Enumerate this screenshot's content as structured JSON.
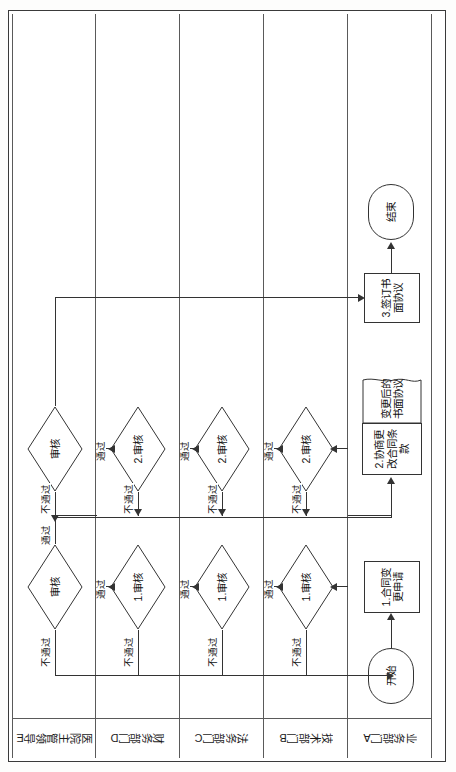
{
  "diagram": {
    "type": "swimlane-flowchart",
    "orientation": "rotated-90-ccw",
    "title_visible": false,
    "lanes": [
      {
        "id": "E",
        "label": "医院主管领导E"
      },
      {
        "id": "D",
        "label": "财务部门D"
      },
      {
        "id": "C",
        "label": "法务部门C"
      },
      {
        "id": "B",
        "label": "技术部门B"
      },
      {
        "id": "A",
        "label": "业务部门A"
      }
    ],
    "nodes": {
      "start": {
        "label": "开始",
        "shape": "terminator",
        "lane": "A"
      },
      "p1": {
        "label": "1.合同变更申请",
        "shape": "process",
        "lane": "A"
      },
      "p2": {
        "label": "2.协商更改合同条款",
        "shape": "process",
        "lane": "A"
      },
      "doc1": {
        "label": "变更后的书面协议",
        "shape": "document",
        "lane": "A"
      },
      "p3": {
        "label": "3.签订书面协议",
        "shape": "process",
        "lane": "A"
      },
      "end": {
        "label": "结束",
        "shape": "terminator",
        "lane": "A"
      },
      "b1": {
        "label": "1.审核",
        "shape": "decision",
        "lane": "B"
      },
      "b2": {
        "label": "2.审核",
        "shape": "decision",
        "lane": "B"
      },
      "c1": {
        "label": "1.审核",
        "shape": "decision",
        "lane": "C"
      },
      "c2": {
        "label": "2.审核",
        "shape": "decision",
        "lane": "C"
      },
      "d1": {
        "label": "1.审核",
        "shape": "decision",
        "lane": "D"
      },
      "d2": {
        "label": "2.审核",
        "shape": "decision",
        "lane": "D"
      },
      "e1": {
        "label": "审核",
        "shape": "decision",
        "lane": "E"
      },
      "e2": {
        "label": "审核",
        "shape": "decision",
        "lane": "E"
      }
    },
    "edge_labels": {
      "pass": "通过",
      "fail": "不通过"
    },
    "edges": [
      {
        "from": "start",
        "to": "p1",
        "label": ""
      },
      {
        "from": "p1",
        "to": "b1",
        "label": ""
      },
      {
        "from": "b1",
        "to": "c1",
        "label": "通过"
      },
      {
        "from": "b1",
        "to": "p1",
        "label": "不通过"
      },
      {
        "from": "c1",
        "to": "d1",
        "label": "通过"
      },
      {
        "from": "c1",
        "to": "p1",
        "label": "不通过"
      },
      {
        "from": "d1",
        "to": "e1",
        "label": "通过"
      },
      {
        "from": "d1",
        "to": "p1",
        "label": "不通过"
      },
      {
        "from": "e1",
        "to": "p2",
        "label": "通过"
      },
      {
        "from": "e1",
        "to": "p1",
        "label": "不通过"
      },
      {
        "from": "p2",
        "to": "b2",
        "label": ""
      },
      {
        "from": "b2",
        "to": "c2",
        "label": "通过"
      },
      {
        "from": "b2",
        "to": "p2",
        "label": "不通过"
      },
      {
        "from": "c2",
        "to": "d2",
        "label": "通过"
      },
      {
        "from": "c2",
        "to": "p2",
        "label": "不通过"
      },
      {
        "from": "d2",
        "to": "e2",
        "label": "通过"
      },
      {
        "from": "d2",
        "to": "p2",
        "label": "不通过"
      },
      {
        "from": "e2",
        "to": "p3",
        "label": "通过"
      },
      {
        "from": "e2",
        "to": "p2",
        "label": "不通过"
      },
      {
        "from": "p3",
        "to": "end",
        "label": ""
      }
    ],
    "colors": {
      "stroke": "#333333",
      "lane_border": "#5a5a5a",
      "page_border": "#3a3a3a",
      "background": "#ffffff",
      "text": "#111111"
    }
  }
}
